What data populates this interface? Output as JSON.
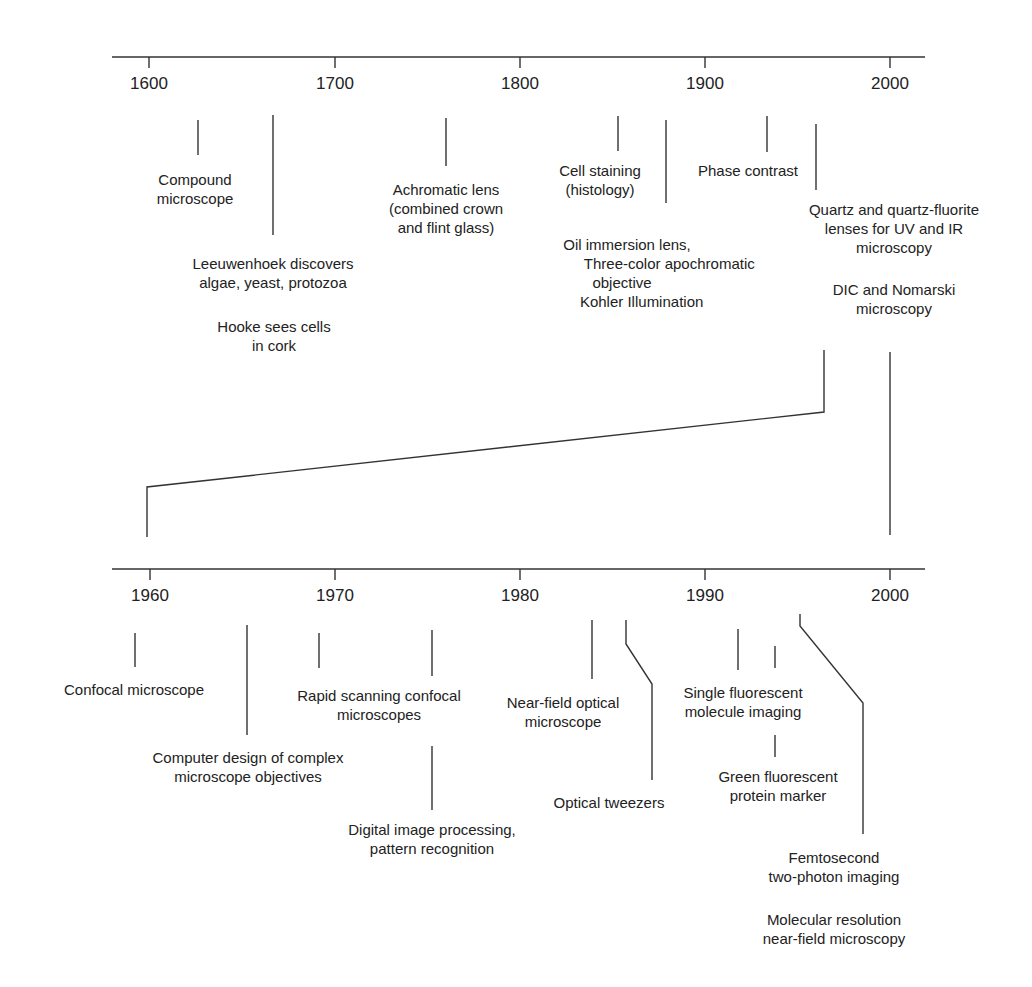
{
  "title": "",
  "colors": {
    "line": "#333333",
    "text": "#222222",
    "background": "#ffffff"
  },
  "top_timeline": {
    "range": [
      1600,
      2000
    ],
    "ticks": [
      "1600",
      "1700",
      "1800",
      "1900",
      "2000"
    ],
    "events": [
      {
        "label": "Compound\nmicroscope",
        "approx_year": 1625
      },
      {
        "label": "Leeuwenhoek discovers\nalgae, yeast, protozoa",
        "approx_year": 1665
      },
      {
        "label": "Hooke sees cells\nin cork",
        "approx_year": 1665
      },
      {
        "label": "Achromatic lens\n(combined crown\nand flint glass)",
        "approx_year": 1758
      },
      {
        "label": "Cell staining\n(histology)",
        "approx_year": 1850
      },
      {
        "label": "Oil immersion lens,\n     Three-color apochromatic\n       objective\n    Kohler Illumination",
        "approx_year": 1878
      },
      {
        "label": "Phase contrast",
        "approx_year": 1932
      },
      {
        "label": "Quartz and quartz-fluorite\nlenses for UV and IR\nmicroscopy",
        "approx_year": 1960
      },
      {
        "label": "DIC and Nomarski\nmicroscopy",
        "approx_year": 1960
      }
    ]
  },
  "bottom_timeline": {
    "range": [
      1960,
      2000
    ],
    "ticks": [
      "1960",
      "1970",
      "1980",
      "1990",
      "2000"
    ],
    "events": [
      {
        "label": "Confocal microscope",
        "approx_year": 1957
      },
      {
        "label": "Computer design of complex\nmicroscope objectives",
        "approx_year": 1965
      },
      {
        "label": "Rapid scanning confocal\nmicroscopes",
        "approx_year": 1969
      },
      {
        "label": "Digital image processing,\npattern recognition",
        "approx_year": 1975
      },
      {
        "label": "Near-field optical\nmicroscope",
        "approx_year": 1984
      },
      {
        "label": "Optical tweezers",
        "approx_year": 1986
      },
      {
        "label": "Single fluorescent\nmolecule imaging",
        "approx_year": 1992
      },
      {
        "label": "Green fluorescent\nprotein marker",
        "approx_year": 1994
      },
      {
        "label": "Femtosecond\ntwo-photon imaging",
        "approx_year": 1995
      },
      {
        "label": "Molecular resolution\nnear-field microscopy",
        "approx_year": 1995
      }
    ]
  }
}
